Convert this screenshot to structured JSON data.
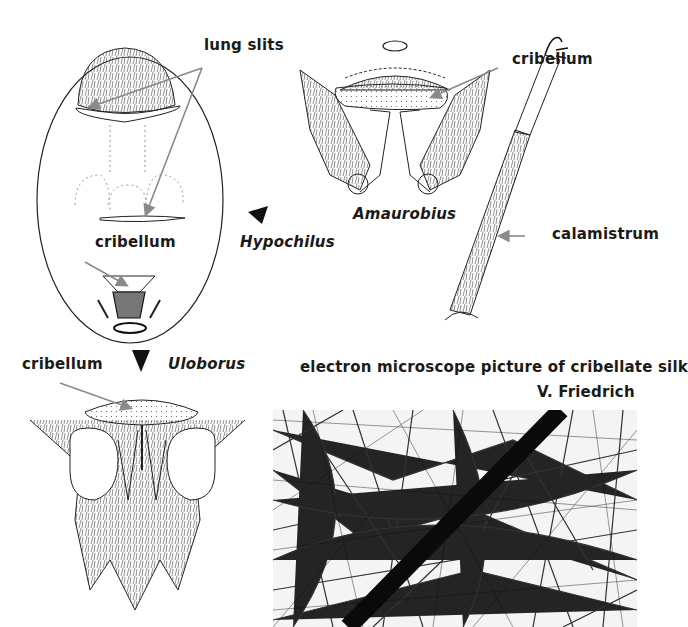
{
  "figure": {
    "panels": {
      "hypochilus": {
        "taxon": "Hypochilus",
        "labels": {
          "lung_slits": "lung slits",
          "cribellum": "cribellum"
        },
        "marker": "triangle-pointer-left"
      },
      "amaurobius": {
        "taxon": "Amaurobius",
        "labels": {
          "cribellum": "cribellum"
        }
      },
      "leg": {
        "labels": {
          "calamistrum": "calamistrum"
        }
      },
      "uloborus": {
        "taxon": "Uloborus",
        "labels": {
          "cribellum": "cribellum"
        },
        "marker": "triangle-pointer-down"
      },
      "silk_micrograph": {
        "caption": "electron microscope picture of cribellate silk",
        "credit": "V. Friedrich"
      }
    },
    "colors": {
      "ink": "#1a1a1a",
      "arrow": "#8a8a8a",
      "paper": "#ffffff"
    }
  }
}
